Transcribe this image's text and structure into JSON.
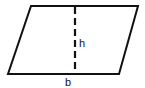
{
  "diagram": {
    "shape": "parallelogram",
    "vertices": [
      [
        31,
        6
      ],
      [
        138,
        6
      ],
      [
        119,
        74
      ],
      [
        8,
        74
      ]
    ],
    "height_line": {
      "x": 75,
      "y1": 6,
      "y2": 74,
      "style": "dashed"
    },
    "labels": {
      "height": "h",
      "base": "b"
    },
    "stroke_color": "#111111",
    "background": "#ffffff"
  }
}
